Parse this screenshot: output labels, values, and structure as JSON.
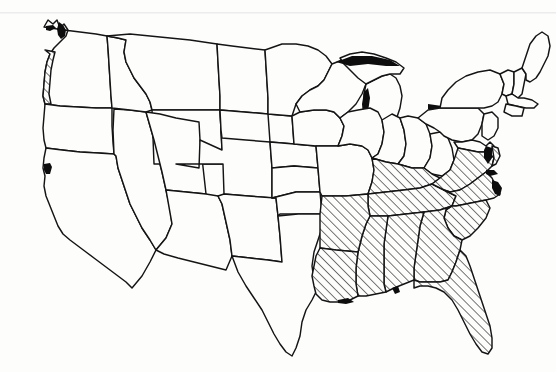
{
  "map": {
    "title": "United States Outline Map",
    "description": "Black-and-white outline map of the contiguous United States with a group of states filled with diagonal hatching",
    "projection_note": "contiguous 48 states",
    "background_color": "#fdfdfc",
    "line_color": "#141414",
    "hatch_color": "#141414",
    "water_color": "#0d0d0d",
    "legend": {
      "hatched_meaning": "highlighted region",
      "plain_meaning": "not highlighted"
    },
    "hatch": {
      "angle_degrees": 45,
      "direction": "lower-left to upper-right",
      "spacing_px": 4.5,
      "line_width_px": 1.1
    },
    "highlighted_states": [
      "Virginia",
      "North Carolina",
      "South Carolina",
      "Georgia",
      "Florida",
      "Alabama",
      "Mississippi",
      "Tennessee",
      "Kentucky",
      "Arkansas",
      "Louisiana",
      "Western Washington coastal strip"
    ],
    "plain_states": [
      "Washington (interior)",
      "Oregon",
      "California",
      "Nevada",
      "Idaho",
      "Montana",
      "Wyoming",
      "Utah",
      "Arizona",
      "Colorado",
      "New Mexico",
      "North Dakota",
      "South Dakota",
      "Nebraska",
      "Kansas",
      "Oklahoma",
      "Texas",
      "Minnesota",
      "Iowa",
      "Missouri",
      "Wisconsin",
      "Illinois",
      "Michigan",
      "Indiana",
      "Ohio",
      "West Virginia",
      "Pennsylvania",
      "New York",
      "Maryland",
      "Delaware",
      "New Jersey",
      "Connecticut",
      "Rhode Island",
      "Massachusetts",
      "Vermont",
      "New Hampshire",
      "Maine"
    ],
    "counts": {
      "highlighted": 11,
      "total_states_drawn": 48
    }
  }
}
